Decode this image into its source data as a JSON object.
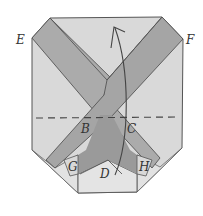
{
  "diagram": {
    "type": "origami-fold-step",
    "labels": {
      "E": "E",
      "F": "F",
      "B": "B",
      "C": "C",
      "D": "D",
      "G": "G",
      "H": "H"
    },
    "colors": {
      "paper_light": "#dcdcdc",
      "paper_mid": "#c8c8c8",
      "band": "#a9a9a9",
      "band_dark": "#969696",
      "outline": "#555555",
      "fold_line": "#444444"
    },
    "annotations": {
      "fold_line": "horizontal valley fold (dashed) through B and C",
      "arrow": "curved arrow pointing up — fold bottom up"
    }
  }
}
